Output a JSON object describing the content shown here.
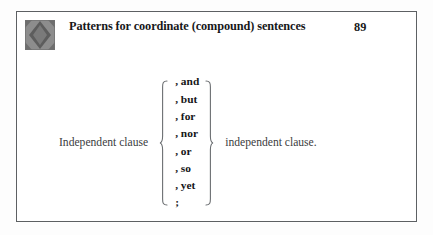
{
  "figure": {
    "header": {
      "icon_name": "diamond-pattern-icon",
      "title": "Patterns for coordinate (compound) sentences",
      "page_number": "89"
    },
    "diagram": {
      "left_clause": "Independent clause",
      "right_clause": "independent clause.",
      "left_brace": "{",
      "right_brace": "}",
      "conjunctions": [
        ", and",
        ", but",
        ", for",
        ", nor",
        ", or",
        ", so",
        ", yet",
        ";"
      ]
    }
  },
  "colors": {
    "page_background": "#fdfdfd",
    "box_background": "#ffffff",
    "box_border": "#5d6063",
    "title_text": "#17181a",
    "body_text": "#3b3d40",
    "conjunction_text": "#151618",
    "brace": "#6c6f72",
    "icon_base": "#8a8a8a",
    "icon_diamond": "#5f5f5f"
  }
}
